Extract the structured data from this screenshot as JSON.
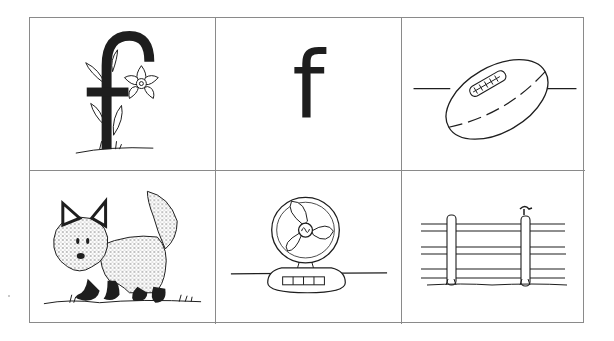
{
  "worksheet": {
    "title": "Letter F picture cards",
    "cells": [
      {
        "id": "flower-f",
        "label": "Letter f decorated with a daffodil and leaves",
        "row": 1,
        "col": 1
      },
      {
        "id": "letter-f",
        "label": "f",
        "row": 1,
        "col": 2
      },
      {
        "id": "football",
        "label": "football",
        "row": 1,
        "col": 3
      },
      {
        "id": "fox",
        "label": "fox",
        "row": 2,
        "col": 1
      },
      {
        "id": "fan",
        "label": "fan",
        "row": 2,
        "col": 2
      },
      {
        "id": "fence",
        "label": "fence",
        "row": 2,
        "col": 3
      }
    ],
    "letter_text": "f"
  },
  "colors": {
    "ink": "#1e1e1e",
    "grid_line": "#8a8a8a",
    "background": "#ffffff"
  }
}
